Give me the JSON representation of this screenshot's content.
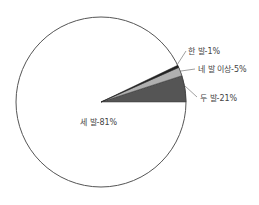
{
  "chart_data": {
    "type": "pie",
    "title": "",
    "slices": [
      {
        "label": "두 발-21%",
        "name": "두 발",
        "value": 21,
        "color": "#555555",
        "start_deg": 0,
        "end_deg": 18
      },
      {
        "label": "네 발 이상-5%",
        "name": "네 발 이상",
        "value": 5,
        "color": "#b0b0b0",
        "start_deg": 18,
        "end_deg": 24
      },
      {
        "label": "한 발-1%",
        "name": "한 발",
        "value": 1,
        "color": "#222222",
        "start_deg": 24,
        "end_deg": 25.6
      },
      {
        "label": "세 발-81%",
        "name": "세 발",
        "value": 81,
        "color": "#ffffff",
        "start_deg": 25.6,
        "end_deg": 360
      }
    ],
    "categories": [
      "두 발",
      "네 발 이상",
      "한 발",
      "세 발"
    ],
    "values": [
      21,
      5,
      1,
      81
    ],
    "legend": "none (inline labels with leader lines)"
  },
  "labels": {
    "one": "한 발-1%",
    "four_plus": "네 발 이상-5%",
    "two": "두 발-21%",
    "three": "세 발-81%"
  }
}
